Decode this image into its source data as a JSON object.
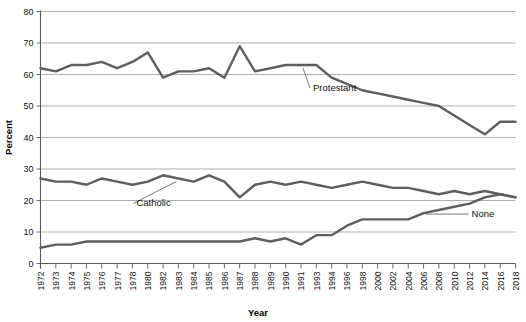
{
  "chart_data": {
    "type": "line",
    "title": "",
    "xlabel": "Year",
    "ylabel": "Percent",
    "ylim": [
      0,
      80
    ],
    "ytick_step": 10,
    "yticks": [
      0,
      10,
      20,
      30,
      40,
      50,
      60,
      70,
      80
    ],
    "grid": true,
    "legend_position": "inline-annotations",
    "line_color": "#5e5e5e",
    "gridline_color": "#8c8c8c",
    "axis_color": "#5a5a5a",
    "background_color": "#ffffff",
    "categories": [
      "1972",
      "1973",
      "1974",
      "1975",
      "1976",
      "1977",
      "1978",
      "1980",
      "1982",
      "1983",
      "1984",
      "1985",
      "1986",
      "1987",
      "1988",
      "1989",
      "1990",
      "1991",
      "1993",
      "1994",
      "1996",
      "1998",
      "2000",
      "2002",
      "2004",
      "2006",
      "2008",
      "2010",
      "2012",
      "2014",
      "2016",
      "2018"
    ],
    "series": [
      {
        "name": "Protestant",
        "label": "Protestant",
        "values": [
          62,
          61,
          63,
          63,
          64,
          62,
          64,
          67,
          59,
          61,
          61,
          62,
          59,
          69,
          61,
          62,
          63,
          63,
          63,
          59,
          57,
          55,
          54,
          53,
          52,
          51,
          50,
          47,
          44,
          41,
          45,
          45
        ]
      },
      {
        "name": "Catholic",
        "label": "Catholic",
        "values": [
          27,
          26,
          26,
          25,
          27,
          26,
          25,
          26,
          28,
          27,
          26,
          28,
          26,
          21,
          25,
          26,
          25,
          26,
          25,
          24,
          25,
          26,
          25,
          24,
          24,
          23,
          22,
          23,
          22,
          23,
          22,
          21
        ]
      },
      {
        "name": "None",
        "label": "None",
        "values": [
          5,
          6,
          6,
          7,
          7,
          7,
          7,
          7,
          7,
          7,
          7,
          7,
          7,
          7,
          8,
          7,
          8,
          6,
          9,
          9,
          12,
          14,
          14,
          14,
          14,
          16,
          17,
          18,
          19,
          21,
          22,
          21
        ]
      }
    ],
    "annotations": [
      {
        "text": "Protestant",
        "series": "Protestant",
        "anchor_year": "1991"
      },
      {
        "text": "Catholic",
        "series": "Catholic",
        "anchor_year": "1983"
      },
      {
        "text": "None",
        "series": "None",
        "anchor_year": "2006"
      }
    ]
  }
}
